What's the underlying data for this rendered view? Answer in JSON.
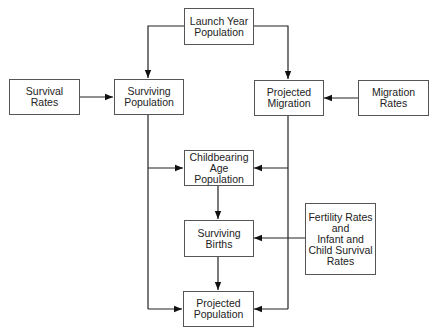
{
  "diagram": {
    "nodes": {
      "launch_year": "Launch Year\nPopulation",
      "survival_rates": "Survival\nRates",
      "surviving_population": "Surviving\nPopulation",
      "projected_migration": "Projected\nMigration",
      "migration_rates": "Migration\nRates",
      "childbearing": "Childbearing\nAge\nPopulation",
      "surviving_births": "Surviving\nBirths",
      "fertility": "Fertility Rates\nand\nInfant and\nChild Survival\nRates",
      "projected_population": "Projected\nPopulation"
    },
    "edges": [
      {
        "from": "Launch Year Population",
        "to": "Surviving Population"
      },
      {
        "from": "Launch Year Population",
        "to": "Projected Migration"
      },
      {
        "from": "Survival Rates",
        "to": "Surviving Population"
      },
      {
        "from": "Migration Rates",
        "to": "Projected Migration"
      },
      {
        "from": "Surviving Population",
        "to": "Childbearing Age Population"
      },
      {
        "from": "Surviving Population",
        "to": "Projected Population"
      },
      {
        "from": "Projected Migration",
        "to": "Childbearing Age Population"
      },
      {
        "from": "Projected Migration",
        "to": "Projected Population"
      },
      {
        "from": "Childbearing Age Population",
        "to": "Surviving Births"
      },
      {
        "from": "Fertility Rates and Infant and Child Survival Rates",
        "to": "Surviving Births"
      },
      {
        "from": "Surviving Births",
        "to": "Projected Population"
      }
    ]
  }
}
